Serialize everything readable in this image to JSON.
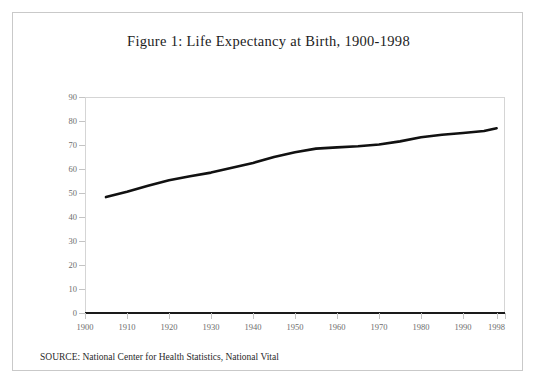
{
  "figure": {
    "title": "Figure 1: Life Expectancy at Birth, 1900-1998",
    "source_note": "SOURCE: National Center for Health Statistics, National Vital"
  },
  "chart_data": {
    "type": "line",
    "title": "Figure 1: Life Expectancy at Birth, 1900-1998",
    "xlabel": "",
    "ylabel": "",
    "xlim": [
      1900,
      2000
    ],
    "ylim": [
      0,
      90
    ],
    "grid": false,
    "legend": "none",
    "line_color": "#111111",
    "x_tick_labels": [
      "1900",
      "1910",
      "1920",
      "1930",
      "1940",
      "1950",
      "1960",
      "1970",
      "1980",
      "1990",
      "1998"
    ],
    "x_tick_values": [
      1900,
      1910,
      1920,
      1930,
      1940,
      1950,
      1960,
      1970,
      1980,
      1990,
      1998
    ],
    "y_tick_labels": [
      "0",
      "10",
      "20",
      "30",
      "40",
      "50",
      "60",
      "70",
      "80",
      "90"
    ],
    "y_tick_values": [
      0,
      10,
      20,
      30,
      40,
      50,
      60,
      70,
      80,
      90
    ],
    "series": [
      {
        "name": "Life expectancy at birth (years)",
        "x": [
          1905,
          1910,
          1915,
          1920,
          1925,
          1930,
          1935,
          1940,
          1945,
          1950,
          1955,
          1960,
          1965,
          1970,
          1975,
          1980,
          1985,
          1990,
          1995,
          1998
        ],
        "values": [
          48.3,
          50.5,
          53.0,
          55.3,
          57.0,
          58.5,
          60.5,
          62.5,
          65.0,
          67.0,
          68.5,
          69.0,
          69.5,
          70.2,
          71.5,
          73.2,
          74.3,
          75.0,
          75.8,
          77.0
        ]
      }
    ]
  }
}
